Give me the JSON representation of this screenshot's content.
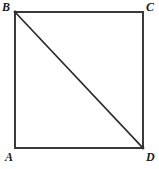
{
  "figure": {
    "type": "geometry-diagram",
    "shape": "square-with-diagonal",
    "background_color": "#ffffff",
    "stroke_color": "#3a3a3a",
    "diagonal_color": "#2b2b2b",
    "label_color": "#1a1a1a",
    "square": {
      "left": 15,
      "top": 12,
      "right": 143,
      "bottom": 148,
      "width": 128,
      "height": 136,
      "stroke_width": 1.6
    },
    "diagonal": {
      "from": "B",
      "to": "D",
      "x1": 15,
      "y1": 12,
      "x2": 143,
      "y2": 148,
      "stroke_width": 1.6
    },
    "vertices": [
      {
        "id": "B",
        "label": "B",
        "corner": "top-left",
        "x": 15,
        "y": 12
      },
      {
        "id": "C",
        "label": "C",
        "corner": "top-right",
        "x": 143,
        "y": 12
      },
      {
        "id": "A",
        "label": "A",
        "corner": "bottom-left",
        "x": 15,
        "y": 148
      },
      {
        "id": "D",
        "label": "D",
        "corner": "bottom-right",
        "x": 143,
        "y": 148
      }
    ],
    "edges": [
      {
        "id": "BC",
        "from": "B",
        "to": "C",
        "side": "top"
      },
      {
        "id": "CD",
        "from": "C",
        "to": "D",
        "side": "right"
      },
      {
        "id": "AD",
        "from": "A",
        "to": "D",
        "side": "bottom"
      },
      {
        "id": "AB",
        "from": "A",
        "to": "B",
        "side": "left"
      }
    ]
  }
}
